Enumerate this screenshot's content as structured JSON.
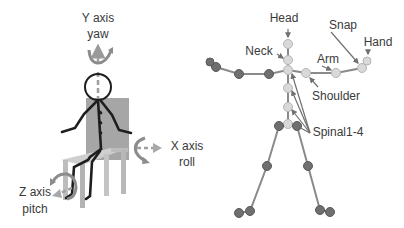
{
  "left_figure": {
    "title": "Seated person rotation axes",
    "labels": {
      "y_axis": "Y axis",
      "y_rot": "yaw",
      "x_axis": "X axis",
      "x_rot": "roll",
      "z_axis": "Z axis",
      "z_rot": "pitch"
    },
    "colors": {
      "figure": "#1e1e1e",
      "chair_back": "#a6a6a6",
      "chair_seat": "#cfcfcf",
      "axis": "#a0a0a0",
      "axis_rotation": "#8c8c8c"
    }
  },
  "right_figure": {
    "title": "Skeleton joint model",
    "labels": {
      "head": "Head",
      "neck": "Neck",
      "arm": "Arm",
      "snap": "Snap",
      "hand": "Hand",
      "shoulder": "Shoulder",
      "spinal": "Spinal1-4"
    },
    "colors": {
      "bone": "#8a8a8a",
      "highlight_joint": "#d9d9d9",
      "other_joint": "#6f6f6f",
      "pointer": "#707070"
    }
  }
}
